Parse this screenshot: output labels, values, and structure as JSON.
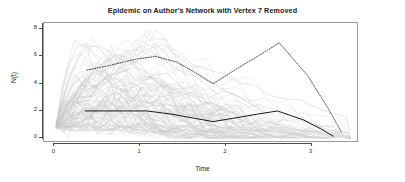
{
  "chart_data": {
    "type": "line",
    "title": "Epidemic on Author's Network with Vertex 7 Removed",
    "xlabel": "Time",
    "ylabel": "N(t)",
    "xlim": [
      -0.12,
      3.55
    ],
    "ylim": [
      -0.35,
      8.45
    ],
    "xticks": [
      0,
      1,
      2,
      3
    ],
    "xtick_labels": [
      "0",
      "1",
      "2",
      "3"
    ],
    "yticks": [
      0,
      2,
      4,
      6,
      8
    ],
    "ytick_labels": [
      "0",
      "2",
      "4",
      "6",
      "8"
    ],
    "grid": false,
    "legend": null,
    "colors": {
      "background_trajectories": "#c8c8c8",
      "highlight_solid": "#1a1a1a",
      "highlight_dotted": "#2b2b2b",
      "axis": "#4d4d4d",
      "frame": "#9b9b9b"
    },
    "series": [
      {
        "name": "highlighted-dotted-run",
        "style": "dotted",
        "color": "#2b2b2b",
        "x": [
          0.38,
          0.62,
          0.95,
          1.18,
          1.42,
          1.62,
          1.85,
          2.18,
          2.42,
          2.62,
          2.95,
          3.18,
          3.35
        ],
        "y": [
          5.0,
          5.3,
          5.8,
          6.0,
          5.6,
          4.9,
          4.0,
          5.3,
          6.2,
          7.0,
          4.6,
          2.3,
          0.4
        ]
      },
      {
        "name": "highlighted-solid-run",
        "style": "solid",
        "color": "#1a1a1a",
        "x": [
          0.36,
          0.72,
          1.08,
          1.35,
          1.6,
          1.85,
          2.12,
          2.38,
          2.6,
          2.9,
          3.1,
          3.25
        ],
        "y": [
          2.0,
          2.0,
          2.0,
          1.78,
          1.5,
          1.22,
          1.5,
          1.78,
          2.0,
          1.35,
          0.7,
          0.15
        ]
      },
      {
        "name": "background-replicates",
        "style": "solid-faint",
        "color": "#c8c8c8",
        "count": 100,
        "note": "Dense ensemble of epidemic replicate curves rising steeply near t=0 to peaks between 1 and 8, then decaying toward 0 by t≈3.4"
      }
    ]
  }
}
